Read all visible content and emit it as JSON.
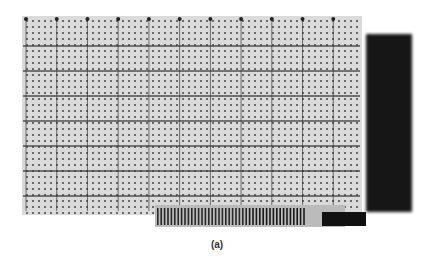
{
  "figure": {
    "caption": "(a)",
    "board_color": "#d9d9d9",
    "hole_color": "#444444",
    "trace_color": "#3a3a3a",
    "panel_color": "#141414",
    "connector_color": "#2a2a2a",
    "vertical_bus_count": 11,
    "horizontal_bus_count": 8
  }
}
